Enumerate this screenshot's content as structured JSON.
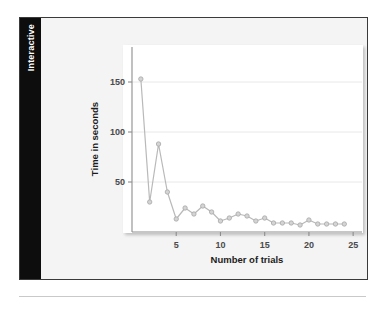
{
  "figure": {
    "side_tab_label": "Interactive",
    "background_color": "#f4f4f4",
    "tab_color": "#0d0d0d",
    "border_color": "#3a3a3a"
  },
  "chart_data": {
    "type": "line",
    "title": "",
    "xlabel": "Number of trials",
    "ylabel": "Time in seconds",
    "xlim": [
      0,
      26
    ],
    "ylim": [
      0,
      185
    ],
    "xticks": [
      5,
      10,
      15,
      20,
      25
    ],
    "yticks": [
      50,
      100,
      150
    ],
    "grid": true,
    "grid_axis": "y",
    "legend": false,
    "marker": "circle",
    "line_color": "#b9b9b9",
    "marker_fill": "#d4d4d4",
    "marker_edge": "#a8a8a8",
    "x": [
      1,
      2,
      3,
      4,
      5,
      6,
      7,
      8,
      9,
      10,
      11,
      12,
      13,
      14,
      15,
      16,
      17,
      18,
      19,
      20,
      21,
      22,
      23,
      24
    ],
    "values": [
      153,
      30,
      88,
      40,
      13,
      24,
      18,
      26,
      20,
      11,
      14,
      18,
      16,
      11,
      14,
      9,
      9,
      9,
      7,
      12,
      8,
      8,
      8,
      8
    ]
  }
}
